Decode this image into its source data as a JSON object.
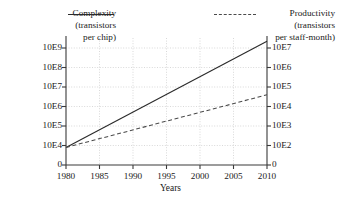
{
  "chart_data": {
    "type": "line",
    "title": "",
    "xlabel": "Years",
    "grid": "dotted-both-axes",
    "legend_position": "top",
    "x": [
      1980,
      1985,
      1990,
      1995,
      2000,
      2005,
      2010
    ],
    "xlim": [
      1980,
      2010
    ],
    "xtick_labels": [
      "1980",
      "1985",
      "1990",
      "1995",
      "2000",
      "2005",
      "2010"
    ],
    "axes": [
      {
        "id": "left",
        "label": "Complexity (transistors per chip)",
        "tick_labels": [
          "0",
          "10E4",
          "10E5",
          "10E6",
          "10E7",
          "10E8",
          "10E9"
        ],
        "tick_values": [
          0,
          10000,
          100000,
          1000000,
          10000000,
          100000000,
          1000000000
        ],
        "scale": "log-decade"
      },
      {
        "id": "right",
        "label": "Productivity (transistors per staff-month)",
        "tick_labels": [
          "0",
          "10E2",
          "10E3",
          "10E4",
          "10E5",
          "10E6",
          "10E7"
        ],
        "tick_values": [
          0,
          100,
          1000,
          10000,
          100000,
          1000000,
          10000000
        ],
        "scale": "log-decade"
      }
    ],
    "series": [
      {
        "name": "Complexity",
        "axis": "left",
        "style": "solid",
        "color": "#2b2b2b",
        "units": "transistors per chip",
        "x": [
          1980,
          2010
        ],
        "values": [
          20000,
          5000000000
        ],
        "decade_positions": [
          0.9,
          6.35
        ]
      },
      {
        "name": "Productivity",
        "axis": "right",
        "style": "dashed",
        "color": "#4a4a4a",
        "units": "transistors per staff-month",
        "x": [
          1980,
          2010
        ],
        "values": [
          200,
          30000
        ],
        "decade_positions": [
          0.9,
          3.6
        ]
      }
    ],
    "annotations": []
  },
  "legend": {
    "left": {
      "name": "Complexity",
      "line_style": "solid",
      "sub_line_1": "(transistors",
      "sub_line_2": "per chip)"
    },
    "right": {
      "name": "Productivity",
      "line_style": "dashed",
      "sub_line_1": "(transistors",
      "sub_line_2": "per staff-month)"
    }
  },
  "axis_titles": {
    "x": "Years"
  },
  "y_left_ticks": [
    "10E9",
    "10E8",
    "10E7",
    "10E6",
    "10E5",
    "10E4",
    "0"
  ],
  "y_right_ticks": [
    "10E7",
    "10E6",
    "10E5",
    "10E4",
    "10E3",
    "10E2",
    "0"
  ],
  "x_ticks": [
    "1980",
    "1985",
    "1990",
    "1995",
    "2000",
    "2005",
    "2010"
  ]
}
